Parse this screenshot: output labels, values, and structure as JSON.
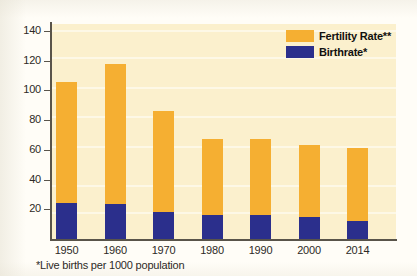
{
  "chart_data": {
    "type": "bar",
    "stacked": true,
    "title": "",
    "xlabel": "",
    "ylabel": "",
    "categories": [
      "1950",
      "1960",
      "1970",
      "1980",
      "1990",
      "2000",
      "2014"
    ],
    "series": [
      {
        "name": "Birthrate*",
        "color": "#2b2f8c",
        "values": [
          24,
          23.5,
          18,
          16,
          16,
          15,
          12
        ]
      },
      {
        "name": "Fertility Rate**",
        "color": "#f5af32",
        "values": [
          81.5,
          94.5,
          68,
          51,
          51,
          48,
          49
        ]
      }
    ],
    "totals": [
      105.5,
      118,
      86,
      67,
      67,
      63,
      61
    ],
    "ylim": [
      0,
      148
    ],
    "yticks": [
      20,
      40,
      60,
      80,
      100,
      120,
      140
    ],
    "ytick_labels": [
      "20",
      "40",
      "60",
      "80",
      "100",
      "120",
      "140"
    ],
    "grid": true,
    "legend_position": "top-right",
    "plot_background": "#fbf0cd",
    "annotations": [
      "*Live births per 1000 population"
    ]
  },
  "legend": {
    "items": [
      {
        "label": "Fertility Rate**",
        "color": "#f5af32"
      },
      {
        "label": "Birthrate*",
        "color": "#2b2f8c"
      }
    ]
  },
  "footnote": "*Live births per 1000 population"
}
